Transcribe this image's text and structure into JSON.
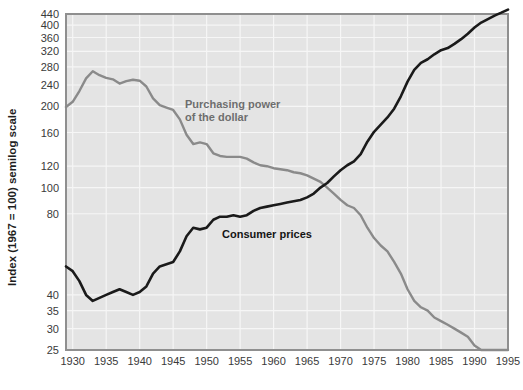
{
  "chart_data": {
    "type": "line",
    "title": "",
    "xlabel": "",
    "ylabel": "Index (1967 = 100) semilog scale",
    "scale": "semilog",
    "grid": true,
    "legend": "inline-annotations",
    "xlim": [
      1929,
      1995
    ],
    "ylim": [
      25,
      440
    ],
    "xticks": [
      1930,
      1935,
      1940,
      1945,
      1950,
      1955,
      1960,
      1965,
      1970,
      1975,
      1980,
      1985,
      1990,
      1995
    ],
    "xtick_labels": [
      "1930",
      "1935",
      "1940",
      "1945",
      "1950",
      "1955",
      "1960",
      "1965",
      "1970",
      "1975",
      "1980",
      "1985",
      "1990",
      "1995"
    ],
    "yticks": [
      25,
      30,
      35,
      40,
      80,
      100,
      120,
      160,
      200,
      240,
      280,
      320,
      360,
      400,
      440
    ],
    "ytick_labels": [
      "25",
      "30",
      "35",
      "40",
      "80",
      "100",
      "120",
      "160",
      "200",
      "240",
      "280",
      "320",
      "360",
      "400",
      "440"
    ],
    "series": [
      {
        "name": "Purchasing power of the dollar",
        "color": "#8a8a8a",
        "label_x": 1944.0,
        "label_y": 205,
        "x": [
          1929,
          1930,
          1931,
          1932,
          1933,
          1934,
          1935,
          1936,
          1937,
          1938,
          1939,
          1940,
          1941,
          1942,
          1943,
          1944,
          1945,
          1946,
          1947,
          1948,
          1949,
          1950,
          1951,
          1952,
          1953,
          1954,
          1955,
          1956,
          1957,
          1958,
          1959,
          1960,
          1961,
          1962,
          1963,
          1964,
          1965,
          1966,
          1967,
          1968,
          1969,
          1970,
          1971,
          1972,
          1973,
          1974,
          1975,
          1976,
          1977,
          1978,
          1979,
          1980,
          1981,
          1982,
          1983,
          1984,
          1985,
          1986,
          1987,
          1988,
          1989,
          1990,
          1991,
          1992,
          1993,
          1994,
          1995
        ],
        "y": [
          199,
          208,
          228,
          254,
          270,
          261,
          255,
          252,
          243,
          248,
          251,
          249,
          237,
          214,
          202,
          198,
          194,
          179,
          157,
          145,
          147,
          145,
          134,
          131,
          130,
          130,
          130,
          128,
          124,
          121,
          120,
          118,
          117,
          116,
          114,
          113,
          111,
          108,
          105,
          100,
          95,
          90,
          86,
          84,
          79,
          71,
          65,
          61,
          58,
          53,
          48,
          42,
          38,
          36,
          35,
          33,
          32,
          31,
          30,
          29,
          28,
          26,
          25,
          25,
          25,
          25,
          25
        ]
      },
      {
        "name": "Consumer prices",
        "color": "#1a1a1a",
        "label_x": 1953.5,
        "label_y": 74,
        "x": [
          1929,
          1930,
          1931,
          1932,
          1933,
          1934,
          1935,
          1936,
          1937,
          1938,
          1939,
          1940,
          1941,
          1942,
          1943,
          1944,
          1945,
          1946,
          1947,
          1948,
          1949,
          1950,
          1951,
          1952,
          1953,
          1954,
          1955,
          1956,
          1957,
          1958,
          1959,
          1960,
          1961,
          1962,
          1963,
          1964,
          1965,
          1966,
          1967,
          1968,
          1969,
          1970,
          1971,
          1972,
          1973,
          1974,
          1975,
          1976,
          1977,
          1978,
          1979,
          1980,
          1981,
          1982,
          1983,
          1984,
          1985,
          1986,
          1987,
          1988,
          1989,
          1990,
          1991,
          1992,
          1993,
          1994,
          1995
        ],
        "y": [
          51,
          49,
          45,
          40,
          38,
          39,
          40,
          41,
          42,
          41,
          40,
          41,
          43,
          48,
          51,
          52,
          53,
          58,
          66,
          71,
          70,
          71,
          76,
          78,
          78,
          79,
          78,
          79,
          82,
          84,
          85,
          86,
          87,
          88,
          89,
          90,
          92,
          95,
          100,
          104,
          110,
          116,
          121,
          125,
          133,
          148,
          161,
          171,
          182,
          196,
          218,
          247,
          273,
          290,
          299,
          312,
          323,
          329,
          341,
          355,
          372,
          392,
          409,
          421,
          434,
          445,
          457
        ]
      }
    ],
    "annotations": [
      {
        "text_line1": "Purchasing power",
        "text_line2": "of the dollar",
        "series": "purchasing-power"
      },
      {
        "text_line1": "Consumer prices",
        "text_line2": "",
        "series": "consumer-prices"
      }
    ]
  },
  "axes": {
    "y_axis_title": "Index (1967 = 100) semilog scale"
  },
  "labels": {
    "purchasing_power_line1": "Purchasing power",
    "purchasing_power_line2": "of the dollar",
    "consumer_prices": "Consumer prices"
  },
  "colors": {
    "plot_background": "#e4e4e4",
    "gridline": "#f6f6f6",
    "frame": "#8f8f8f",
    "purchasing_power": "#8a8a8a",
    "consumer_prices": "#1a1a1a",
    "tick_text": "#3a3a3a",
    "page_background": "#ffffff"
  }
}
